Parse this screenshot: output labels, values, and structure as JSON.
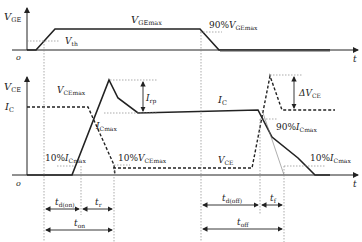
{
  "diagram": {
    "top_panel": {
      "y_axis": {
        "symbol": "V",
        "sub": "GE"
      },
      "origin": "o",
      "x_axis": "t",
      "labels": {
        "vgemax": {
          "symbol": "V",
          "sub": "GEmax"
        },
        "vth": {
          "symbol": "V",
          "sub": "th"
        },
        "pct90_prefix": "90%",
        "pct90": {
          "symbol": "V",
          "sub": "GEmax"
        }
      }
    },
    "bottom_panel": {
      "y_axis": {
        "symbol": "V",
        "sub": "CE"
      },
      "origin": "o",
      "x_axis": "t",
      "ic_axis_label": {
        "symbol": "I",
        "sub": "C"
      },
      "labels": {
        "vcemax": {
          "symbol": "V",
          "sub": "CEmax"
        },
        "irr": {
          "symbol": "I",
          "sub": "rp"
        },
        "icmax": {
          "symbol": "I",
          "sub": "Cmax"
        },
        "ic_mid": {
          "symbol": "I",
          "sub": "C"
        },
        "dvce": {
          "prefix": "Δ",
          "symbol": "V",
          "sub": "CE"
        },
        "pct90_ic_prefix": "90%",
        "pct90_ic": {
          "symbol": "I",
          "sub": "Cmax"
        },
        "pct10_ic_left_prefix": "10%",
        "pct10_ic_left": {
          "symbol": "I",
          "sub": "Cmax"
        },
        "pct10_vce_prefix": "10%",
        "pct10_vce": {
          "symbol": "V",
          "sub": "CEmax"
        },
        "vce_low": {
          "symbol": "V",
          "sub": "CE"
        },
        "pct10_ic_right_prefix": "10%",
        "pct10_ic_right": {
          "symbol": "I",
          "sub": "Cmax"
        }
      }
    },
    "timing": {
      "td_on": {
        "symbol": "t",
        "sub": "d(on)"
      },
      "tr": {
        "symbol": "t",
        "sub": "r"
      },
      "t_on": {
        "symbol": "t",
        "sub": "on"
      },
      "td_off": {
        "symbol": "t",
        "sub": "d(off)"
      },
      "tf": {
        "symbol": "t",
        "sub": "f"
      },
      "t_off": {
        "symbol": "t",
        "sub": "off"
      }
    },
    "legend": {
      "solid": "current / gate voltage",
      "dashed": "collector-emitter voltage"
    }
  }
}
